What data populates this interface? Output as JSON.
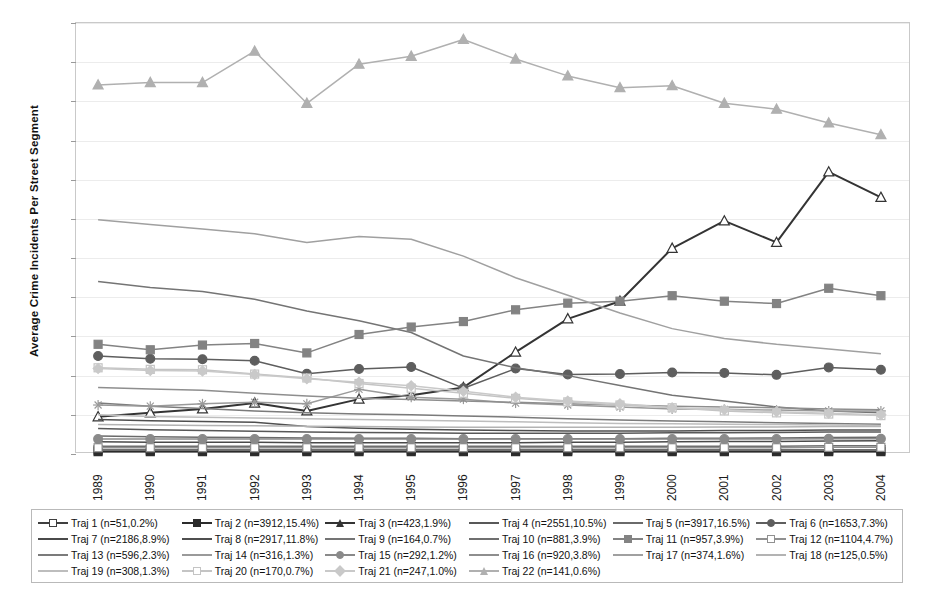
{
  "chart_data": {
    "type": "line",
    "title": "",
    "xlabel": "",
    "ylabel": "Average  Crime Incidents Per Street Segment",
    "ylim": [
      0,
      110
    ],
    "ytick_step": 10,
    "yticks": [
      0,
      10,
      20,
      30,
      40,
      50,
      60,
      70,
      80,
      90,
      100,
      110
    ],
    "grid": true,
    "legend_position": "bottom",
    "categories": [
      "1989",
      "1990",
      "1991",
      "1992",
      "1993",
      "1994",
      "1995",
      "1996",
      "1997",
      "1998",
      "1999",
      "2000",
      "2001",
      "2002",
      "2003",
      "2004"
    ],
    "series": [
      {
        "name": "Traj 1",
        "label": "Traj 1 (n=51,0.2%)",
        "n": 51,
        "pct": "0.2%",
        "color": "#3f3f3f",
        "marker": "square",
        "marker_fill": "none",
        "values": [
          1.0,
          1.0,
          1.0,
          1.0,
          1.0,
          1.0,
          1.0,
          1.0,
          1.0,
          1.0,
          1.0,
          1.0,
          1.0,
          1.0,
          1.0,
          1.0
        ]
      },
      {
        "name": "Traj 2",
        "label": "Traj 2 (n=3912,15.4%)",
        "n": 3912,
        "pct": "15.4%",
        "color": "#2b2b2b",
        "marker": "square",
        "marker_fill": "solid",
        "values": [
          0.6,
          0.6,
          0.6,
          0.6,
          0.6,
          0.6,
          0.6,
          0.6,
          0.6,
          0.6,
          0.6,
          0.6,
          0.6,
          0.6,
          0.6,
          0.6
        ]
      },
      {
        "name": "Traj 3",
        "label": "Traj 3 (n=423,1.9%)",
        "n": 423,
        "pct": "1.9%",
        "color": "#343434",
        "marker": "triangle",
        "marker_fill": "none",
        "values": [
          9.5,
          10.5,
          11.5,
          13.0,
          11.0,
          14.0,
          15.0,
          17.0,
          26.0,
          34.5,
          39.0,
          52.5,
          59.5,
          54.0,
          72.0,
          65.5
        ]
      },
      {
        "name": "Traj 4",
        "label": "Traj 4 (n=2551,10.5%)",
        "n": 2551,
        "pct": "10.5%",
        "color": "#585858",
        "marker": "none",
        "marker_fill": "none",
        "values": [
          6.5,
          6.2,
          6.0,
          5.8,
          5.6,
          5.5,
          5.4,
          5.3,
          5.3,
          5.3,
          5.3,
          5.4,
          5.4,
          5.5,
          5.6,
          5.6
        ]
      },
      {
        "name": "Traj 5",
        "label": "Traj 5 (n=3917,16.5%)",
        "n": 3917,
        "pct": "16.5%",
        "color": "#6a6a6a",
        "marker": "none",
        "marker_fill": "none",
        "values": [
          4.6,
          4.4,
          4.3,
          4.2,
          4.1,
          4.0,
          4.0,
          3.9,
          3.9,
          3.9,
          3.9,
          4.0,
          4.0,
          4.1,
          4.2,
          4.3
        ]
      },
      {
        "name": "Traj 6",
        "label": "Traj 6 (n=1653,7.3%)",
        "n": 1653,
        "pct": "7.3%",
        "color": "#5e5e5e",
        "marker": "circle",
        "marker_fill": "solid",
        "values": [
          25.0,
          24.3,
          24.2,
          23.8,
          20.5,
          21.7,
          22.2,
          16.8,
          21.8,
          20.3,
          20.4,
          20.8,
          20.7,
          20.2,
          22.1,
          21.5
        ]
      },
      {
        "name": "Traj 7",
        "label": "Traj 7 (n=2186,8.9%)",
        "n": 2186,
        "pct": "8.9%",
        "color": "#4a4a4a",
        "marker": "none",
        "marker_fill": "none",
        "values": [
          3.1,
          3.0,
          3.0,
          3.0,
          2.9,
          2.9,
          2.9,
          2.9,
          2.9,
          3.0,
          3.0,
          3.1,
          3.2,
          3.2,
          3.3,
          3.4
        ]
      },
      {
        "name": "Traj 8",
        "label": "Traj 8 (n=2917,11.8%)",
        "n": 2917,
        "pct": "11.8%",
        "color": "#4f4f4f",
        "marker": "none",
        "marker_fill": "none",
        "values": [
          8.8,
          8.5,
          8.3,
          8.1,
          7.0,
          6.6,
          6.3,
          6.1,
          6.0,
          5.9,
          5.9,
          5.9,
          6.0,
          6.0,
          6.1,
          6.1
        ]
      },
      {
        "name": "Traj 9",
        "label": "Traj 9 (n=164,0.7%)",
        "n": 164,
        "pct": "0.7%",
        "color": "#747474",
        "marker": "none",
        "marker_fill": "none",
        "values": [
          44.0,
          42.5,
          41.5,
          39.5,
          36.5,
          34.0,
          31.0,
          25.0,
          22.0,
          20.0,
          17.5,
          15.0,
          13.5,
          12.0,
          11.0,
          10.5
        ]
      },
      {
        "name": "Traj 10",
        "label": "Traj 10 (n=881,3.9%)",
        "n": 881,
        "pct": "3.9%",
        "color": "#6f6f6f",
        "marker": "plus",
        "marker_fill": "none",
        "values": [
          2.0,
          2.0,
          2.0,
          2.0,
          2.0,
          2.0,
          2.0,
          2.0,
          2.0,
          2.0,
          2.0,
          2.0,
          2.0,
          2.0,
          2.1,
          2.1
        ]
      },
      {
        "name": "Traj 11",
        "label": "Traj 11 (n=957,3.9%)",
        "n": 957,
        "pct": "3.9%",
        "color": "#838383",
        "marker": "square",
        "marker_fill": "solid",
        "values": [
          28.0,
          26.6,
          27.8,
          28.2,
          25.8,
          30.5,
          32.4,
          33.8,
          36.8,
          38.5,
          39.0,
          40.4,
          39.0,
          38.4,
          42.3,
          40.4
        ]
      },
      {
        "name": "Traj 12",
        "label": "Traj 12 (n=1104,4.7%)",
        "n": 1104,
        "pct": "4.7%",
        "color": "#909090",
        "marker": "square",
        "marker_fill": "none",
        "values": [
          1.6,
          1.6,
          1.6,
          1.6,
          1.6,
          1.6,
          1.6,
          1.6,
          1.6,
          1.6,
          1.6,
          1.6,
          1.6,
          1.6,
          1.7,
          1.7
        ]
      },
      {
        "name": "Traj 13",
        "label": "Traj 13 (n=596,2.3%)",
        "n": 596,
        "pct": "2.3%",
        "color": "#7b7b7b",
        "marker": "none",
        "marker_fill": "none",
        "values": [
          13.0,
          12.2,
          11.6,
          11.0,
          10.5,
          10.2,
          10.0,
          9.7,
          9.4,
          9.0,
          8.7,
          8.4,
          8.2,
          8.0,
          7.8,
          7.6
        ]
      },
      {
        "name": "Traj 14",
        "label": "Traj 14 (n=316,1.3%)",
        "n": 316,
        "pct": "1.3%",
        "color": "#9a9a9a",
        "marker": "star",
        "marker_fill": "none",
        "values": [
          12.5,
          12.2,
          12.8,
          13.2,
          12.8,
          16.5,
          14.5,
          14.0,
          13.0,
          12.5,
          12.0,
          11.5,
          11.4,
          11.2,
          11.0,
          11.0
        ]
      },
      {
        "name": "Traj 15",
        "label": "Traj 15 (n=292,1.2%)",
        "n": 292,
        "pct": "1.2%",
        "color": "#8a8a8a",
        "marker": "circle",
        "marker_fill": "solid",
        "values": [
          3.8,
          3.8,
          3.8,
          3.8,
          3.8,
          3.8,
          3.8,
          3.8,
          3.8,
          3.8,
          3.8,
          3.8,
          3.8,
          3.8,
          3.9,
          3.9
        ]
      },
      {
        "name": "Traj 16",
        "label": "Traj 16 (n=920,3.8%)",
        "n": 920,
        "pct": "3.8%",
        "color": "#8e8e8e",
        "marker": "none",
        "marker_fill": "none",
        "values": [
          17.0,
          16.6,
          16.3,
          15.5,
          14.8,
          14.2,
          13.9,
          13.5,
          13.2,
          12.8,
          12.5,
          12.2,
          12.0,
          11.8,
          11.5,
          11.3
        ]
      },
      {
        "name": "Traj 17",
        "label": "Traj 17 (n=374,1.6%)",
        "n": 374,
        "pct": "1.6%",
        "color": "#a0a0a0",
        "marker": "none",
        "marker_fill": "none",
        "values": [
          59.8,
          58.6,
          57.4,
          56.2,
          54.0,
          55.5,
          54.8,
          50.5,
          45.0,
          40.5,
          36.0,
          32.0,
          29.5,
          28.0,
          26.8,
          25.6
        ]
      },
      {
        "name": "Traj 18",
        "label": "Traj 18 (n=125,0.5%)",
        "n": 125,
        "pct": "0.5%",
        "color": "#b3b3b3",
        "marker": "none",
        "marker_fill": "none",
        "values": [
          7.5,
          7.4,
          7.3,
          7.2,
          7.1,
          7.0,
          6.9,
          6.8,
          6.8,
          6.8,
          6.8,
          6.8,
          6.9,
          6.9,
          7.0,
          7.0
        ]
      },
      {
        "name": "Traj 19",
        "label": "Traj 19 (n=308,1.3%)",
        "n": 308,
        "pct": "1.3%",
        "color": "#bdbdbd",
        "marker": "none",
        "marker_fill": "none",
        "values": [
          10.0,
          9.6,
          9.4,
          9.2,
          9.0,
          8.8,
          8.6,
          8.4,
          8.2,
          8.0,
          7.8,
          7.7,
          7.6,
          7.5,
          7.4,
          7.3
        ]
      },
      {
        "name": "Traj 20",
        "label": "Traj 20 (n=170,0.7%)",
        "n": 170,
        "pct": "0.7%",
        "color": "#c4c4c4",
        "marker": "square",
        "marker_fill": "none",
        "values": [
          22.0,
          21.6,
          21.5,
          20.4,
          19.4,
          18.0,
          16.8,
          15.5,
          14.2,
          13.3,
          12.5,
          11.8,
          11.0,
          10.5,
          10.2,
          9.8
        ]
      },
      {
        "name": "Traj 21",
        "label": "Traj 21 (n=247,1.0%)",
        "n": 247,
        "pct": "1.0%",
        "color": "#c9c9c9",
        "marker": "diamond",
        "marker_fill": "solid",
        "values": [
          21.8,
          21.3,
          21.2,
          20.3,
          19.2,
          18.3,
          17.4,
          16.0,
          14.5,
          13.5,
          12.8,
          11.8,
          11.3,
          10.8,
          10.4,
          10.0
        ]
      },
      {
        "name": "Traj 22",
        "label": "Traj 22 (n=141,0.6%)",
        "n": 141,
        "pct": "0.6%",
        "color": "#b0b0b0",
        "marker": "triangle",
        "marker_fill": "solid",
        "values": [
          94.2,
          94.8,
          94.8,
          102.8,
          89.5,
          99.5,
          101.5,
          105.8,
          100.8,
          96.5,
          93.5,
          94.0,
          89.5,
          88.0,
          84.5,
          81.5
        ]
      }
    ]
  },
  "axis": {
    "y_title": "Average  Crime Incidents Per Street Segment",
    "y_labels": [
      "110",
      "100",
      "90",
      "80",
      "70",
      "60",
      "50",
      "40",
      "30",
      "20",
      "10",
      "0"
    ],
    "x_labels": [
      "1989",
      "1990",
      "1991",
      "1992",
      "1993",
      "1994",
      "1995",
      "1996",
      "1997",
      "1998",
      "1999",
      "2000",
      "2001",
      "2002",
      "2003",
      "2004"
    ]
  },
  "legend": {
    "order": [
      "Traj 1 (n=51,0.2%)",
      "Traj 2 (n=3912,15.4%)",
      "Traj 3 (n=423,1.9%)",
      "Traj 4 (n=2551,10.5%)",
      "Traj 5 (n=3917,16.5%)",
      "Traj 6 (n=1653,7.3%)",
      "Traj 7 (n=2186,8.9%)",
      "Traj 8 (n=2917,11.8%)",
      "Traj 9 (n=164,0.7%)",
      "Traj 10 (n=881,3.9%)",
      "Traj 11 (n=957,3.9%)",
      "Traj 12 (n=1104,4.7%)",
      "Traj 13 (n=596,2.3%)",
      "Traj 14 (n=316,1.3%)",
      "Traj 15 (n=292,1.2%)",
      "Traj 16 (n=920,3.8%)",
      "Traj 17 (n=374,1.6%)",
      "Traj 18 (n=125,0.5%)",
      "Traj 19 (n=308,1.3%)",
      "Traj 20 (n=170,0.7%)",
      "Traj 21 (n=247,1.0%)",
      "Traj 22 (n=141,0.6%)"
    ]
  },
  "colors": {
    "background": "#ffffff",
    "plot_border": "#c9c9c9",
    "gridline": "#ececec",
    "axis_text": "#1a1a1a",
    "legend_border": "#b9b9b9"
  }
}
